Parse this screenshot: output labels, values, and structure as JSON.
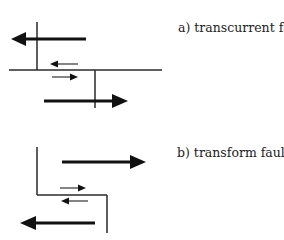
{
  "diagram": {
    "panels": [
      {
        "id": "a",
        "label": "a)  transcurrent fault",
        "fault_trace": "offset horizontal fault with vertical ridge segments on opposite sides",
        "large_arrows": [
          {
            "direction": "left",
            "position": "upper block"
          },
          {
            "direction": "right",
            "position": "lower block"
          }
        ],
        "small_arrows": [
          {
            "direction": "left",
            "position": "above fault"
          },
          {
            "direction": "right",
            "position": "below fault"
          }
        ]
      },
      {
        "id": "b",
        "label": "b) transform fault",
        "fault_trace": "step-shaped ridge-transform-ridge",
        "large_arrows": [
          {
            "direction": "right",
            "position": "upper block"
          },
          {
            "direction": "left",
            "position": "lower block"
          }
        ],
        "small_arrows": [
          {
            "direction": "right",
            "position": "above fault"
          },
          {
            "direction": "left",
            "position": "below fault"
          }
        ]
      }
    ],
    "colors": {
      "line": "#2a2a2a",
      "arrow": "#111111",
      "background": "#ffffff"
    }
  }
}
